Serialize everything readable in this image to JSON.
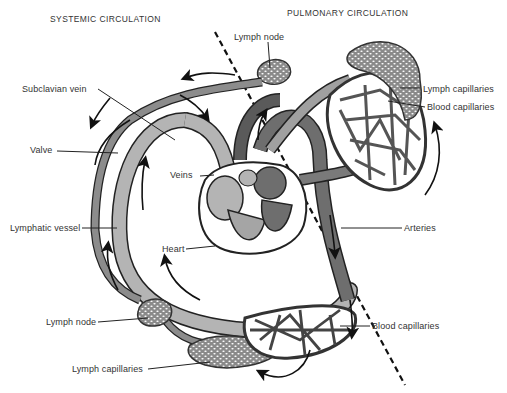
{
  "headers": {
    "left": "SYSTEMIC CIRCULATION",
    "right": "PULMONARY CIRCULATION"
  },
  "labels": {
    "lymph_node_top": "Lymph node",
    "lymph_capillaries_right": "Lymph capillaries",
    "blood_capillaries_right": "Blood capillaries",
    "subclavian_vein": "Subclavian vein",
    "valve": "Valve",
    "veins": "Veins",
    "heart": "Heart",
    "arteries": "Arteries",
    "lymphatic_vessel": "Lymphatic vessel",
    "lymph_node_bottom": "Lymph node",
    "blood_capillaries_bottom": "Blood capillaries",
    "lymph_capillaries_bottom": "Lymph capillaries"
  },
  "colors": {
    "background": "#ffffff",
    "vein_fill": "#b4b4b4",
    "artery_fill": "#6e6e6e",
    "lymph_fill": "#8c8c8c",
    "outline": "#222222",
    "text": "#333333"
  }
}
